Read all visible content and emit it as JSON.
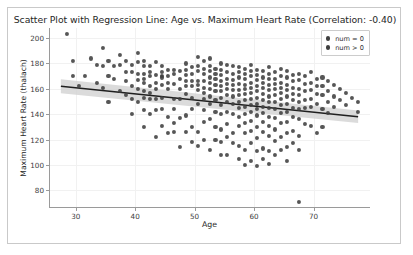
{
  "chart_data": {
    "type": "scatter",
    "title": "Scatter Plot with Regression Line: Age vs. Maximum Heart Rate (Correlation: -0.40)",
    "xlabel": "Age",
    "ylabel": "Maximum Heart Rate (thalach)",
    "correlation": -0.4,
    "xlim": [
      25.5,
      79.5
    ],
    "ylim": [
      66,
      208
    ],
    "xticks": [
      30,
      40,
      50,
      60,
      70
    ],
    "yticks": [
      80,
      100,
      120,
      140,
      160,
      180,
      200
    ],
    "grid": true,
    "legend_position": "upper right",
    "legend": [
      {
        "label": "num = 0",
        "color": "#3f3f3f"
      },
      {
        "label": "num > 0",
        "color": "#3f3f3f"
      }
    ],
    "marker_color": "#3f3f3f",
    "regression": {
      "line_color": "#1f1f1f",
      "band_color": "#cfcfcf",
      "x_start": 27.5,
      "x_end": 77.5,
      "y_start": 162.0,
      "y_end": 138.0,
      "band_half_width_start": 5.5,
      "band_half_width_end": 5.0
    },
    "points": [
      [
        28.5,
        203
      ],
      [
        29.5,
        182
      ],
      [
        29.5,
        170
      ],
      [
        30.5,
        162
      ],
      [
        31.5,
        170
      ],
      [
        33.5,
        179
      ],
      [
        34.5,
        192
      ],
      [
        34.5,
        178
      ],
      [
        34.5,
        161
      ],
      [
        35.5,
        182
      ],
      [
        35.5,
        170
      ],
      [
        35.5,
        150
      ],
      [
        36.5,
        178
      ],
      [
        37.5,
        187
      ],
      [
        37.5,
        179
      ],
      [
        38.5,
        182
      ],
      [
        38.5,
        173
      ],
      [
        38.5,
        166
      ],
      [
        39.5,
        179
      ],
      [
        39.5,
        173
      ],
      [
        39.5,
        152
      ],
      [
        39.5,
        140
      ],
      [
        40.5,
        188
      ],
      [
        40.5,
        181
      ],
      [
        40.5,
        172
      ],
      [
        40.5,
        167
      ],
      [
        40.5,
        160
      ],
      [
        40.5,
        150
      ],
      [
        41.5,
        182
      ],
      [
        41.5,
        178
      ],
      [
        41.5,
        172
      ],
      [
        41.5,
        168
      ],
      [
        41.5,
        165
      ],
      [
        41.5,
        158
      ],
      [
        41.5,
        153
      ],
      [
        41.5,
        143
      ],
      [
        42.5,
        178
      ],
      [
        42.5,
        173
      ],
      [
        42.5,
        170
      ],
      [
        42.5,
        162
      ],
      [
        42.5,
        157
      ],
      [
        42.5,
        152
      ],
      [
        43.5,
        181
      ],
      [
        43.5,
        171
      ],
      [
        43.5,
        165
      ],
      [
        43.5,
        160
      ],
      [
        43.5,
        143
      ],
      [
        43.5,
        122
      ],
      [
        44.5,
        178
      ],
      [
        44.5,
        173
      ],
      [
        44.5,
        170
      ],
      [
        44.5,
        169
      ],
      [
        44.5,
        163
      ],
      [
        44.5,
        153
      ],
      [
        44.5,
        144
      ],
      [
        45.5,
        175
      ],
      [
        45.5,
        170
      ],
      [
        45.5,
        165
      ],
      [
        45.5,
        160
      ],
      [
        45.5,
        138
      ],
      [
        46.5,
        175
      ],
      [
        46.5,
        172
      ],
      [
        46.5,
        164
      ],
      [
        46.5,
        152
      ],
      [
        46.5,
        144
      ],
      [
        46.5,
        133
      ],
      [
        47.5,
        174
      ],
      [
        47.5,
        168
      ],
      [
        47.5,
        160
      ],
      [
        47.5,
        152
      ],
      [
        48.5,
        180
      ],
      [
        48.5,
        175
      ],
      [
        48.5,
        171
      ],
      [
        48.5,
        166
      ],
      [
        48.5,
        162
      ],
      [
        48.5,
        156
      ],
      [
        48.5,
        139
      ],
      [
        49.5,
        177
      ],
      [
        49.5,
        172
      ],
      [
        49.5,
        166
      ],
      [
        49.5,
        162
      ],
      [
        49.5,
        153
      ],
      [
        49.5,
        144
      ],
      [
        50.5,
        185
      ],
      [
        50.5,
        178
      ],
      [
        50.5,
        174
      ],
      [
        50.5,
        166
      ],
      [
        50.5,
        163
      ],
      [
        50.5,
        159
      ],
      [
        50.5,
        148
      ],
      [
        50.5,
        126
      ],
      [
        51.5,
        182
      ],
      [
        51.5,
        176
      ],
      [
        51.5,
        172
      ],
      [
        51.5,
        166
      ],
      [
        51.5,
        161
      ],
      [
        51.5,
        157
      ],
      [
        51.5,
        152
      ],
      [
        51.5,
        143
      ],
      [
        51.5,
        120
      ],
      [
        52.5,
        184
      ],
      [
        52.5,
        178
      ],
      [
        52.5,
        174
      ],
      [
        52.5,
        169
      ],
      [
        52.5,
        165
      ],
      [
        52.5,
        160
      ],
      [
        52.5,
        154
      ],
      [
        52.5,
        148
      ],
      [
        52.5,
        136
      ],
      [
        53.5,
        176
      ],
      [
        53.5,
        172
      ],
      [
        53.5,
        168
      ],
      [
        53.5,
        163
      ],
      [
        53.5,
        158
      ],
      [
        53.5,
        151
      ],
      [
        53.5,
        142
      ],
      [
        53.5,
        130
      ],
      [
        54.5,
        180
      ],
      [
        54.5,
        175
      ],
      [
        54.5,
        171
      ],
      [
        54.5,
        166
      ],
      [
        54.5,
        162
      ],
      [
        54.5,
        158
      ],
      [
        54.5,
        153
      ],
      [
        54.5,
        147
      ],
      [
        54.5,
        140
      ],
      [
        54.5,
        128
      ],
      [
        54.5,
        118
      ],
      [
        55.5,
        179
      ],
      [
        55.5,
        173
      ],
      [
        55.5,
        168
      ],
      [
        55.5,
        164
      ],
      [
        55.5,
        160
      ],
      [
        55.5,
        155
      ],
      [
        55.5,
        150
      ],
      [
        55.5,
        142
      ],
      [
        55.5,
        132
      ],
      [
        55.5,
        122
      ],
      [
        56.5,
        178
      ],
      [
        56.5,
        172
      ],
      [
        56.5,
        167
      ],
      [
        56.5,
        163
      ],
      [
        56.5,
        159
      ],
      [
        56.5,
        154
      ],
      [
        56.5,
        148
      ],
      [
        56.5,
        140
      ],
      [
        56.5,
        125
      ],
      [
        57.5,
        177
      ],
      [
        57.5,
        173
      ],
      [
        57.5,
        169
      ],
      [
        57.5,
        164
      ],
      [
        57.5,
        159
      ],
      [
        57.5,
        155
      ],
      [
        57.5,
        150
      ],
      [
        57.5,
        145
      ],
      [
        57.5,
        138
      ],
      [
        57.5,
        131
      ],
      [
        57.5,
        115
      ],
      [
        58.5,
        176
      ],
      [
        58.5,
        172
      ],
      [
        58.5,
        168
      ],
      [
        58.5,
        163
      ],
      [
        58.5,
        160
      ],
      [
        58.5,
        156
      ],
      [
        58.5,
        151
      ],
      [
        58.5,
        146
      ],
      [
        58.5,
        140
      ],
      [
        58.5,
        133
      ],
      [
        58.5,
        125
      ],
      [
        58.5,
        112
      ],
      [
        59.5,
        179
      ],
      [
        59.5,
        174
      ],
      [
        59.5,
        170
      ],
      [
        59.5,
        165
      ],
      [
        59.5,
        161
      ],
      [
        59.5,
        157
      ],
      [
        59.5,
        152
      ],
      [
        59.5,
        147
      ],
      [
        59.5,
        142
      ],
      [
        59.5,
        135
      ],
      [
        59.5,
        127
      ],
      [
        59.5,
        117
      ],
      [
        60.5,
        175
      ],
      [
        60.5,
        171
      ],
      [
        60.5,
        167
      ],
      [
        60.5,
        162
      ],
      [
        60.5,
        158
      ],
      [
        60.5,
        153
      ],
      [
        60.5,
        148
      ],
      [
        60.5,
        144
      ],
      [
        60.5,
        139
      ],
      [
        60.5,
        130
      ],
      [
        60.5,
        121
      ],
      [
        60.5,
        111
      ],
      [
        61.5,
        174
      ],
      [
        61.5,
        169
      ],
      [
        61.5,
        165
      ],
      [
        61.5,
        161
      ],
      [
        61.5,
        156
      ],
      [
        61.5,
        151
      ],
      [
        61.5,
        146
      ],
      [
        61.5,
        141
      ],
      [
        61.5,
        134
      ],
      [
        61.5,
        126
      ],
      [
        61.5,
        113
      ],
      [
        62.5,
        177
      ],
      [
        62.5,
        172
      ],
      [
        62.5,
        168
      ],
      [
        62.5,
        163
      ],
      [
        62.5,
        159
      ],
      [
        62.5,
        154
      ],
      [
        62.5,
        150
      ],
      [
        62.5,
        145
      ],
      [
        62.5,
        138
      ],
      [
        62.5,
        131
      ],
      [
        62.5,
        123
      ],
      [
        62.5,
        111
      ],
      [
        63.5,
        173
      ],
      [
        63.5,
        168
      ],
      [
        63.5,
        164
      ],
      [
        63.5,
        160
      ],
      [
        63.5,
        155
      ],
      [
        63.5,
        150
      ],
      [
        63.5,
        144
      ],
      [
        63.5,
        137
      ],
      [
        63.5,
        128
      ],
      [
        63.5,
        119
      ],
      [
        64.5,
        176
      ],
      [
        64.5,
        170
      ],
      [
        64.5,
        165
      ],
      [
        64.5,
        161
      ],
      [
        64.5,
        157
      ],
      [
        64.5,
        152
      ],
      [
        64.5,
        147
      ],
      [
        64.5,
        141
      ],
      [
        64.5,
        133
      ],
      [
        64.5,
        122
      ],
      [
        65.5,
        174
      ],
      [
        65.5,
        169
      ],
      [
        65.5,
        163
      ],
      [
        65.5,
        159
      ],
      [
        65.5,
        154
      ],
      [
        65.5,
        148
      ],
      [
        65.5,
        142
      ],
      [
        65.5,
        134
      ],
      [
        65.5,
        125
      ],
      [
        65.5,
        114
      ],
      [
        66.5,
        171
      ],
      [
        66.5,
        166
      ],
      [
        66.5,
        161
      ],
      [
        66.5,
        156
      ],
      [
        66.5,
        151
      ],
      [
        66.5,
        145
      ],
      [
        66.5,
        138
      ],
      [
        66.5,
        127
      ],
      [
        67.5,
        172
      ],
      [
        67.5,
        167
      ],
      [
        67.5,
        160
      ],
      [
        67.5,
        155
      ],
      [
        67.5,
        150
      ],
      [
        67.5,
        144
      ],
      [
        67.5,
        136
      ],
      [
        67.5,
        123
      ],
      [
        67.5,
        71
      ],
      [
        68.5,
        170
      ],
      [
        68.5,
        164
      ],
      [
        68.5,
        158
      ],
      [
        68.5,
        151
      ],
      [
        68.5,
        145
      ],
      [
        68.5,
        132
      ],
      [
        69.5,
        173
      ],
      [
        69.5,
        165
      ],
      [
        69.5,
        159
      ],
      [
        69.5,
        152
      ],
      [
        69.5,
        146
      ],
      [
        69.5,
        131
      ],
      [
        70.5,
        168
      ],
      [
        70.5,
        162
      ],
      [
        70.5,
        156
      ],
      [
        70.5,
        148
      ],
      [
        70.5,
        125
      ],
      [
        71.5,
        169
      ],
      [
        71.5,
        162
      ],
      [
        71.5,
        155
      ],
      [
        71.5,
        144
      ],
      [
        71.5,
        130
      ],
      [
        72.5,
        166
      ],
      [
        72.5,
        158
      ],
      [
        72.5,
        150
      ],
      [
        72.5,
        141
      ],
      [
        73.5,
        163
      ],
      [
        73.5,
        154
      ],
      [
        73.5,
        146
      ],
      [
        74.5,
        160
      ],
      [
        74.5,
        151
      ],
      [
        75.5,
        157
      ],
      [
        75.5,
        147
      ],
      [
        76.5,
        153
      ],
      [
        77.5,
        150
      ],
      [
        77.5,
        142
      ],
      [
        32.5,
        184
      ],
      [
        33.5,
        165
      ],
      [
        36.5,
        168
      ],
      [
        37.5,
        158
      ],
      [
        38.5,
        155
      ],
      [
        42.5,
        140
      ],
      [
        44.5,
        131
      ],
      [
        47.5,
        137
      ],
      [
        49.5,
        130
      ],
      [
        51.5,
        134
      ],
      [
        53.5,
        120
      ],
      [
        55.5,
        108
      ],
      [
        57.5,
        105
      ],
      [
        59.5,
        103
      ],
      [
        61.5,
        105
      ],
      [
        63.5,
        108
      ],
      [
        65.5,
        103
      ],
      [
        67.5,
        112
      ],
      [
        49.5,
        118
      ],
      [
        47.5,
        114
      ],
      [
        45.5,
        125
      ],
      [
        43.5,
        152
      ],
      [
        41.5,
        130
      ],
      [
        39.5,
        162
      ],
      [
        56.5,
        117
      ],
      [
        58.5,
        100
      ],
      [
        60.5,
        99
      ],
      [
        62.5,
        101
      ],
      [
        64.5,
        112
      ],
      [
        66.5,
        117
      ],
      [
        54.5,
        108
      ],
      [
        52.5,
        112
      ],
      [
        50.5,
        115
      ],
      [
        48.5,
        126
      ],
      [
        46.5,
        126
      ]
    ]
  }
}
